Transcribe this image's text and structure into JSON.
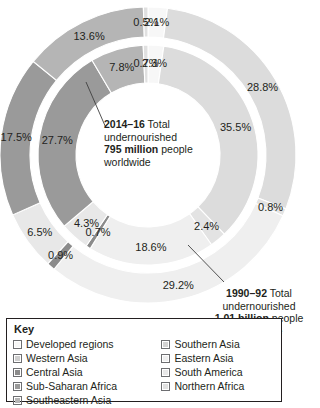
{
  "chart_data": {
    "type": "pie",
    "title": "",
    "subtitle": "",
    "variant": "nested-donut",
    "legend_position": "bottom-left",
    "grid": false,
    "categories": [
      "Developed regions",
      "Southern Asia",
      "Western Asia",
      "Eastern Asia",
      "Central Asia",
      "South America",
      "Sub-Saharan Africa",
      "Northern Africa",
      "Southeastern Asia"
    ],
    "colors": {
      "developed_regions": "#f7f7f7",
      "southern_asia": "#dcdcdc",
      "western_asia": "#e3e3e3",
      "eastern_asia": "#efefef",
      "central_asia": "#8b8b8b",
      "south_america": "#e8e8e8",
      "sub_saharan_africa": "#9a9a9a",
      "northern_africa": "#e0e0e0",
      "southeastern_asia": "#b5b5b5"
    },
    "series": [
      {
        "name": "1990–92",
        "ring": "outer",
        "total_label": "1.01 billion",
        "slices": [
          {
            "label": "Developed regions",
            "value": 2.1,
            "display": "2.1%",
            "color": "#f7f7f7"
          },
          {
            "label": "Southern Asia",
            "value": 28.8,
            "display": "28.8%",
            "color": "#dcdcdc"
          },
          {
            "label": "Western Asia",
            "value": 0.8,
            "display": "0.8%",
            "color": "#e3e3e3"
          },
          {
            "label": "Eastern Asia",
            "value": 29.2,
            "display": "29.2%",
            "color": "#efefef"
          },
          {
            "label": "Central Asia",
            "value": 0.9,
            "display": "0.9%",
            "color": "#8b8b8b"
          },
          {
            "label": "South America",
            "value": 6.5,
            "display": "6.5%",
            "color": "#e8e8e8"
          },
          {
            "label": "Sub-Saharan Africa",
            "value": 17.5,
            "display": "17.5%",
            "color": "#9a9a9a"
          },
          {
            "label": "Southeastern Asia",
            "value": 13.6,
            "display": "13.6%",
            "color": "#b5b5b5"
          },
          {
            "label": "Northern Africa",
            "value": 0.5,
            "display": "0.5%",
            "color": "#e0e0e0"
          }
        ]
      },
      {
        "name": "2014–16",
        "ring": "inner",
        "total_label": "795 million",
        "slices": [
          {
            "label": "Developed regions",
            "value": 2.3,
            "display": "2.3%",
            "color": "#f7f7f7"
          },
          {
            "label": "Southern Asia",
            "value": 35.5,
            "display": "35.5%",
            "color": "#dcdcdc"
          },
          {
            "label": "Western Asia",
            "value": 2.4,
            "display": "2.4%",
            "color": "#e3e3e3"
          },
          {
            "label": "Eastern Asia",
            "value": 18.6,
            "display": "18.6%",
            "color": "#efefef"
          },
          {
            "label": "Central Asia",
            "value": 0.7,
            "display": "0.7%",
            "color": "#8b8b8b"
          },
          {
            "label": "South America",
            "value": 4.3,
            "display": "4.3%",
            "color": "#e8e8e8"
          },
          {
            "label": "Sub-Saharan Africa",
            "value": 27.7,
            "display": "27.7%",
            "color": "#9a9a9a"
          },
          {
            "label": "Southeastern Asia",
            "value": 7.8,
            "display": "7.8%",
            "color": "#b5b5b5"
          },
          {
            "label": "Northern Africa",
            "value": 0.7,
            "display": "0.7%",
            "color": "#e0e0e0"
          }
        ]
      }
    ]
  },
  "center_annotation": {
    "period": "2014–16",
    "line1_rest": " Total",
    "line2": "undernourished",
    "amount": "795 million",
    "line3_rest": " people",
    "line4": "worldwide"
  },
  "outer_annotation": {
    "period": "1990–92",
    "line1_rest": " Total",
    "line2": "undernourished",
    "amount": "1.01 billion",
    "line3_rest": " people",
    "line4": "worldwide"
  },
  "key": {
    "title": "Key",
    "left_items": [
      {
        "label": "Developed regions",
        "color": "#f7f7f7"
      },
      {
        "label": "Western Asia",
        "color": "#cfcfcf"
      },
      {
        "label": "Central Asia",
        "color": "#8b8b8b"
      },
      {
        "label": "Sub-Saharan Africa",
        "color": "#9a9a9a"
      },
      {
        "label": "Southeastern Asia",
        "color": "#b5b5b5"
      }
    ],
    "right_items": [
      {
        "label": "Southern Asia",
        "color": "#d2d2d2"
      },
      {
        "label": "Eastern Asia",
        "color": "#efefef"
      },
      {
        "label": "South America",
        "color": "#e8e8e8"
      },
      {
        "label": "Northern Africa",
        "color": "#e0e0e0"
      }
    ]
  }
}
